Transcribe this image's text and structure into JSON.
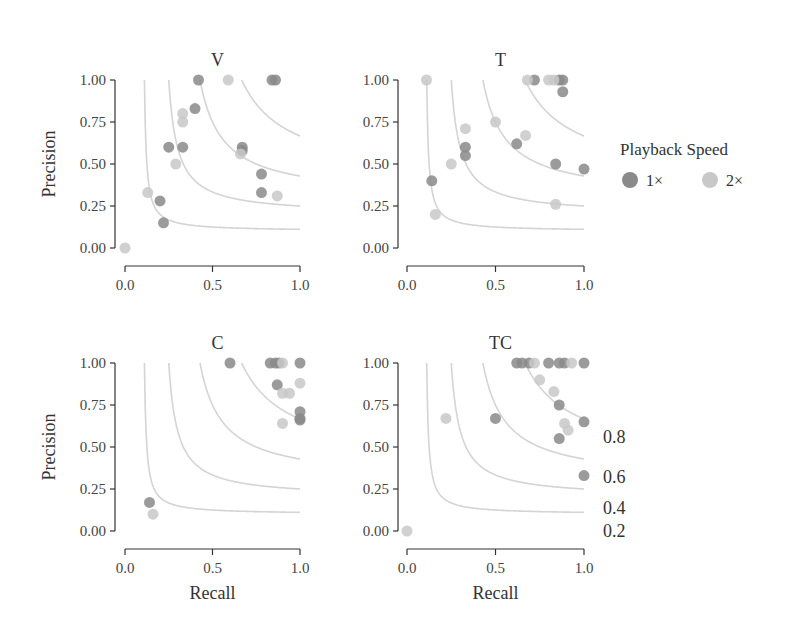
{
  "legend": {
    "title": "Playback Speed",
    "items": [
      {
        "label": "1×",
        "color": "#8a8a8a"
      },
      {
        "label": "2×",
        "color": "#c8c8c8"
      }
    ]
  },
  "iso_f1_labels": [
    "0.8",
    "0.6",
    "0.4",
    "0.2"
  ],
  "axis": {
    "x_title": "Recall",
    "y_title": "Precision",
    "x_ticks": [
      "0.0",
      "0.5",
      "1.0"
    ],
    "y_ticks": [
      "0.00",
      "0.25",
      "0.50",
      "0.75",
      "1.00"
    ]
  },
  "chart_data": [
    {
      "type": "scatter",
      "title": "V",
      "xlabel": "Recall",
      "ylabel": "Precision",
      "xlim": [
        0,
        1
      ],
      "ylim": [
        0,
        1
      ],
      "iso_f1_curves": [
        0.2,
        0.4,
        0.6,
        0.8
      ],
      "series": [
        {
          "name": "1×",
          "points": [
            [
              0.42,
              1.0
            ],
            [
              0.84,
              1.0
            ],
            [
              0.86,
              1.0
            ],
            [
              0.4,
              0.83
            ],
            [
              0.25,
              0.6
            ],
            [
              0.33,
              0.6
            ],
            [
              0.67,
              0.6
            ],
            [
              0.67,
              0.58
            ],
            [
              0.78,
              0.44
            ],
            [
              0.78,
              0.33
            ],
            [
              0.2,
              0.28
            ],
            [
              0.22,
              0.15
            ]
          ]
        },
        {
          "name": "2×",
          "points": [
            [
              0.59,
              1.0
            ],
            [
              0.33,
              0.8
            ],
            [
              0.33,
              0.75
            ],
            [
              0.29,
              0.5
            ],
            [
              0.13,
              0.33
            ],
            [
              0.87,
              0.31
            ],
            [
              0.66,
              0.56
            ],
            [
              0.0,
              0.0
            ]
          ]
        }
      ]
    },
    {
      "type": "scatter",
      "title": "T",
      "xlabel": "Recall",
      "ylabel": "Precision",
      "xlim": [
        0,
        1
      ],
      "ylim": [
        0,
        1
      ],
      "iso_f1_curves": [
        0.2,
        0.4,
        0.6,
        0.8
      ],
      "series": [
        {
          "name": "1×",
          "points": [
            [
              0.72,
              1.0
            ],
            [
              0.86,
              1.0
            ],
            [
              0.88,
              1.0
            ],
            [
              0.88,
              0.93
            ],
            [
              0.33,
              0.6
            ],
            [
              0.33,
              0.55
            ],
            [
              0.62,
              0.62
            ],
            [
              0.84,
              0.5
            ],
            [
              1.0,
              0.47
            ],
            [
              0.14,
              0.4
            ]
          ]
        },
        {
          "name": "2×",
          "points": [
            [
              0.11,
              1.0
            ],
            [
              0.68,
              1.0
            ],
            [
              0.8,
              1.0
            ],
            [
              0.83,
              1.0
            ],
            [
              0.33,
              0.71
            ],
            [
              0.5,
              0.75
            ],
            [
              0.67,
              0.67
            ],
            [
              0.25,
              0.5
            ],
            [
              0.84,
              0.26
            ],
            [
              0.16,
              0.2
            ]
          ]
        }
      ]
    },
    {
      "type": "scatter",
      "title": "C",
      "xlabel": "Recall",
      "ylabel": "Precision",
      "xlim": [
        0,
        1
      ],
      "ylim": [
        0,
        1
      ],
      "iso_f1_curves": [
        0.2,
        0.4,
        0.6,
        0.8
      ],
      "series": [
        {
          "name": "1×",
          "points": [
            [
              0.6,
              1.0
            ],
            [
              0.83,
              1.0
            ],
            [
              0.86,
              1.0
            ],
            [
              0.88,
              1.0
            ],
            [
              1.0,
              1.0
            ],
            [
              0.87,
              0.87
            ],
            [
              1.0,
              0.71
            ],
            [
              1.0,
              0.67
            ],
            [
              1.0,
              0.66
            ],
            [
              0.14,
              0.17
            ]
          ]
        },
        {
          "name": "2×",
          "points": [
            [
              0.9,
              1.0
            ],
            [
              0.9,
              0.82
            ],
            [
              0.94,
              0.82
            ],
            [
              1.0,
              0.88
            ],
            [
              0.9,
              0.64
            ],
            [
              0.16,
              0.1
            ]
          ]
        }
      ]
    },
    {
      "type": "scatter",
      "title": "TC",
      "xlabel": "Recall",
      "ylabel": "Precision",
      "xlim": [
        0,
        1
      ],
      "ylim": [
        0,
        1
      ],
      "iso_f1_curves": [
        0.2,
        0.4,
        0.6,
        0.8
      ],
      "series": [
        {
          "name": "1×",
          "points": [
            [
              0.62,
              1.0
            ],
            [
              0.65,
              1.0
            ],
            [
              0.69,
              1.0
            ],
            [
              0.8,
              1.0
            ],
            [
              0.86,
              1.0
            ],
            [
              0.89,
              1.0
            ],
            [
              1.0,
              1.0
            ],
            [
              0.86,
              0.75
            ],
            [
              0.5,
              0.67
            ],
            [
              1.0,
              0.65
            ],
            [
              0.86,
              0.55
            ],
            [
              1.0,
              0.33
            ]
          ]
        },
        {
          "name": "2×",
          "points": [
            [
              0.72,
              1.0
            ],
            [
              0.93,
              1.0
            ],
            [
              0.75,
              0.9
            ],
            [
              0.83,
              0.83
            ],
            [
              0.89,
              0.64
            ],
            [
              0.91,
              0.6
            ],
            [
              0.22,
              0.67
            ],
            [
              0.0,
              0.0
            ]
          ]
        }
      ]
    }
  ]
}
